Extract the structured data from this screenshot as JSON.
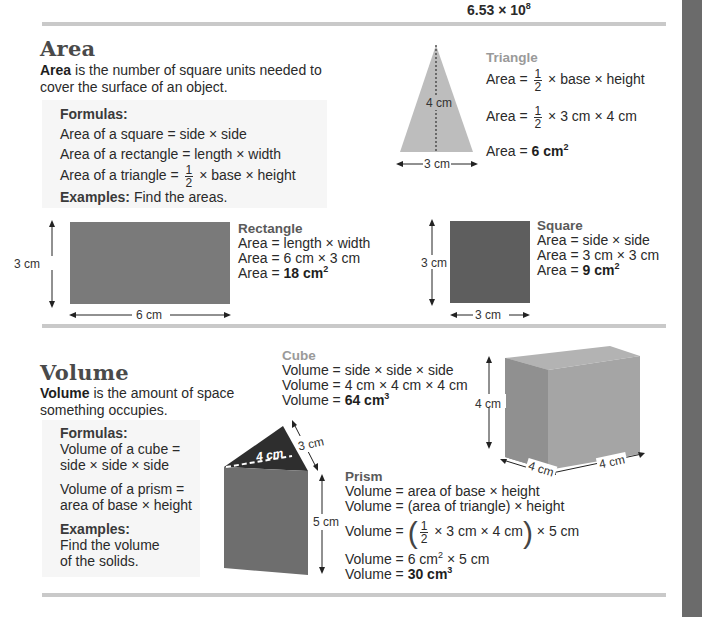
{
  "header": {
    "number_value": "6.53 × 10",
    "number_exponent": "8"
  },
  "colors": {
    "side_bar": "#6b6b6b",
    "rule": "#c9c9c9",
    "shape_dark": "#6e6e6e",
    "shape_light": "#bdbdbd",
    "box_bg": "#f6f6f6"
  },
  "area": {
    "heading": "Area",
    "intro_bold": "Area",
    "intro_rest_1": " is the number of square units needed to",
    "intro_rest_2": "cover the surface of an object.",
    "formulas": {
      "title": "Formulas:",
      "square": "Area of a square = side × side",
      "rectangle": "Area of a rectangle = length × width",
      "triangle_prefix": "Area of a triangle = ",
      "triangle_num": "1",
      "triangle_den": "2",
      "triangle_suffix": " × base × height",
      "examples_label": "Examples:",
      "examples_text": " Find the areas."
    },
    "triangle": {
      "title": "Triangle",
      "eq1_prefix": "Area = ",
      "eq1_num": "1",
      "eq1_den": "2",
      "eq1_suffix": " × base × height",
      "eq2_prefix": "Area = ",
      "eq2_num": "1",
      "eq2_den": "2",
      "eq2_suffix": " × 3 cm × 4 cm",
      "eq3_prefix": "Area = ",
      "eq3_result": "6 cm",
      "eq3_exp": "2",
      "height_label": "4 cm",
      "base_label": "3 cm"
    },
    "rectangle": {
      "title": "Rectangle",
      "eq1": "Area = length × width",
      "eq2": "Area = 6 cm × 3 cm",
      "eq3_prefix": "Area = ",
      "eq3_result": "18 cm",
      "eq3_exp": "2",
      "height_label": "3 cm",
      "width_label": "6 cm"
    },
    "square": {
      "title": "Square",
      "eq1": "Area = side × side",
      "eq2": "Area = 3 cm × 3 cm",
      "eq3_prefix": "Area = ",
      "eq3_result": "9 cm",
      "eq3_exp": "2",
      "height_label": "3 cm",
      "width_label": "3 cm"
    }
  },
  "volume": {
    "heading": "Volume",
    "intro_bold": "Volume",
    "intro_rest_1": " is the amount of space",
    "intro_rest_2": "something occupies.",
    "formulas": {
      "title": "Formulas:",
      "cube_1": "Volume of a cube =",
      "cube_2": "side × side × side",
      "prism_1": "Volume of a prism =",
      "prism_2": "area of base × height",
      "examples_label": "Examples:",
      "examples_1": "Find the volume",
      "examples_2": "of the solids."
    },
    "cube": {
      "title": "Cube",
      "eq1": "Volume = side × side × side",
      "eq2": "Volume = 4 cm × 4 cm × 4 cm",
      "eq3_prefix": "Volume = ",
      "eq3_result": "64 cm",
      "eq3_exp": "3",
      "height_label": "4 cm",
      "depth_label": "4 cm",
      "width_label": "4 cm"
    },
    "prism": {
      "title": "Prism",
      "eq1": "Volume = area of base × height",
      "eq2": "Volume = (area of triangle) × height",
      "eq3_prefix": "Volume = ",
      "eq3_num": "1",
      "eq3_den": "2",
      "eq3_inner": " × 3 cm × 4 cm",
      "eq3_suffix": " × 5 cm",
      "eq4_prefix": "Volume = 6 cm",
      "eq4_exp": "2",
      "eq4_suffix": " × 5 cm",
      "eq5_prefix": "Volume = ",
      "eq5_result": "30 cm",
      "eq5_exp": "3",
      "base_label": "4 cm",
      "side_label": "3 cm",
      "height_label": "5 cm"
    }
  }
}
